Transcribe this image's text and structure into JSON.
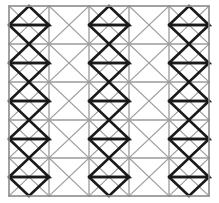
{
  "figure": {
    "name": "triangular-lattice-pattern",
    "background_color": "#ffffff",
    "border_color": "#8a8a8a",
    "grid_line_color": "#9a9a9a",
    "diagonal_color": "#9d9d9d",
    "bold_stroke_color": "#1a1a1a",
    "border_stroke_width": 1.6,
    "grid_stroke_width": 1.3,
    "diagonal_stroke_width": 1.2,
    "bold_stroke_width": 2.6
  },
  "geometry": {
    "origin_x": 9,
    "origin_y": 6,
    "width": 200,
    "height": 190,
    "columns": 5,
    "rows": 5,
    "cell_width": 40,
    "cell_height": 38
  },
  "pattern": {
    "bold_columns": [
      1,
      3,
      5
    ],
    "plain_columns": [
      2,
      4
    ],
    "triangles_per_bold_column": 5,
    "triangle_orientation": "up",
    "triangle_base": "horizontal-grid-line",
    "triangle_apex": "cell-center"
  },
  "chart_data": {
    "type": "diagram",
    "title": "",
    "cells": [
      {
        "row": 1,
        "col": 1,
        "bold": true,
        "triangle": "up"
      },
      {
        "row": 1,
        "col": 2,
        "bold": false,
        "triangle": "none"
      },
      {
        "row": 1,
        "col": 3,
        "bold": true,
        "triangle": "up"
      },
      {
        "row": 1,
        "col": 4,
        "bold": false,
        "triangle": "none"
      },
      {
        "row": 1,
        "col": 5,
        "bold": true,
        "triangle": "up"
      },
      {
        "row": 2,
        "col": 1,
        "bold": true,
        "triangle": "up"
      },
      {
        "row": 2,
        "col": 2,
        "bold": false,
        "triangle": "none"
      },
      {
        "row": 2,
        "col": 3,
        "bold": true,
        "triangle": "up"
      },
      {
        "row": 2,
        "col": 4,
        "bold": false,
        "triangle": "none"
      },
      {
        "row": 2,
        "col": 5,
        "bold": true,
        "triangle": "up"
      },
      {
        "row": 3,
        "col": 1,
        "bold": true,
        "triangle": "up"
      },
      {
        "row": 3,
        "col": 2,
        "bold": false,
        "triangle": "none"
      },
      {
        "row": 3,
        "col": 3,
        "bold": true,
        "triangle": "up"
      },
      {
        "row": 3,
        "col": 4,
        "bold": false,
        "triangle": "none"
      },
      {
        "row": 3,
        "col": 5,
        "bold": true,
        "triangle": "up"
      },
      {
        "row": 4,
        "col": 1,
        "bold": true,
        "triangle": "up"
      },
      {
        "row": 4,
        "col": 2,
        "bold": false,
        "triangle": "none"
      },
      {
        "row": 4,
        "col": 3,
        "bold": true,
        "triangle": "up"
      },
      {
        "row": 4,
        "col": 4,
        "bold": false,
        "triangle": "none"
      },
      {
        "row": 4,
        "col": 5,
        "bold": true,
        "triangle": "up"
      },
      {
        "row": 5,
        "col": 1,
        "bold": true,
        "triangle": "up"
      },
      {
        "row": 5,
        "col": 2,
        "bold": false,
        "triangle": "none"
      },
      {
        "row": 5,
        "col": 3,
        "bold": true,
        "triangle": "up"
      },
      {
        "row": 5,
        "col": 4,
        "bold": false,
        "triangle": "none"
      },
      {
        "row": 5,
        "col": 5,
        "bold": true,
        "triangle": "up"
      }
    ]
  }
}
